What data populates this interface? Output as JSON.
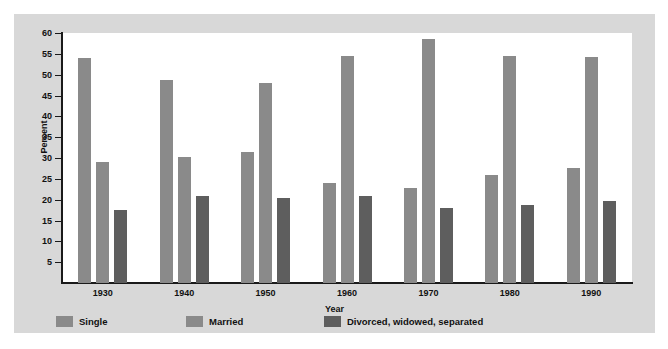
{
  "chart_data": {
    "type": "bar",
    "title": "",
    "xlabel": "Year",
    "ylabel": "Percent",
    "categories": [
      "1930",
      "1940",
      "1950",
      "1960",
      "1970",
      "1980",
      "1990"
    ],
    "ylim": [
      0,
      60
    ],
    "ytick_step": 5,
    "yticks": [
      "5",
      "10",
      "15",
      "20",
      "25",
      "30",
      "35",
      "40",
      "45",
      "50",
      "55",
      "60"
    ],
    "grid": false,
    "legend_position": "bottom",
    "series": [
      {
        "name": "Single",
        "color": "#8a8a8a",
        "values": [
          54.0,
          48.8,
          31.5,
          24.0,
          22.8,
          26.0,
          27.5
        ]
      },
      {
        "name": "Married",
        "color": "#8a8a8a",
        "values": [
          29.0,
          30.3,
          48.0,
          54.5,
          58.5,
          54.5,
          54.3
        ]
      },
      {
        "name": "Divorced, widowed, separated",
        "color": "#5e5e5e",
        "values": [
          17.5,
          21.0,
          20.5,
          21.0,
          18.0,
          18.8,
          19.8
        ]
      }
    ]
  },
  "figure": {
    "background": "#d8d8d8",
    "plot_background": "#ffffff",
    "axis_color": "#1a1a1a"
  }
}
